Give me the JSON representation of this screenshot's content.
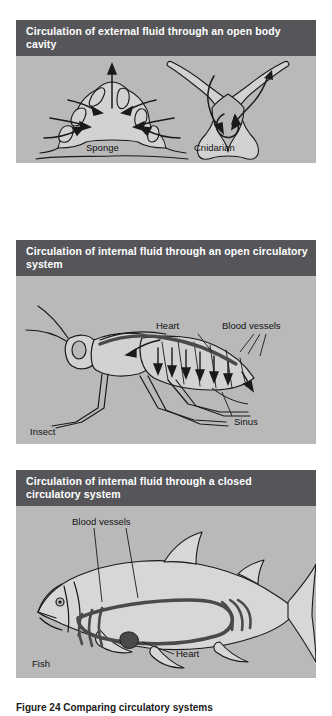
{
  "figure": {
    "caption": "Figure 24  Comparing circulatory systems",
    "panel_bg_color": "#b9b9b9",
    "header_bg_color": "#56565a",
    "header_text_color": "#ffffff",
    "ink_color": "#1a1a1a",
    "vessel_color": "#4a4a4a"
  },
  "panels": [
    {
      "id": "external-open-body-cavity",
      "header": "Circulation of external fluid through an open body cavity",
      "labels": [
        {
          "name": "sponge",
          "text": "Sponge"
        },
        {
          "name": "cnidarian",
          "text": "Cnidarian"
        }
      ]
    },
    {
      "id": "internal-open-circulatory",
      "header": "Circulation of internal fluid through an open circulatory system",
      "labels": [
        {
          "name": "heart",
          "text": "Heart"
        },
        {
          "name": "blood-vessels",
          "text": "Blood vessels"
        },
        {
          "name": "sinus",
          "text": "Sinus"
        },
        {
          "name": "insect",
          "text": "Insect"
        }
      ]
    },
    {
      "id": "internal-closed-circulatory",
      "header": "Circulation of internal fluid through a closed circulatory system",
      "labels": [
        {
          "name": "blood-vessels",
          "text": "Blood vessels"
        },
        {
          "name": "heart",
          "text": "Heart"
        },
        {
          "name": "fish",
          "text": "Fish"
        }
      ]
    }
  ]
}
